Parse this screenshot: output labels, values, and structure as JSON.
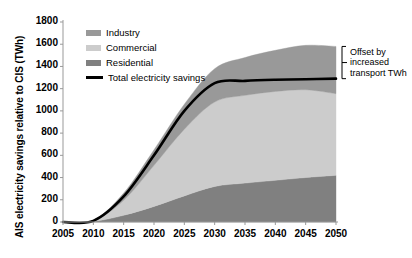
{
  "chart_data": {
    "type": "area",
    "stacked": true,
    "title": "",
    "subtitle": "",
    "xlabel": "",
    "ylabel": "AIS electricity savings relative to CIS  (TWh)",
    "x": [
      2005,
      2010,
      2015,
      2020,
      2025,
      2030,
      2035,
      2040,
      2045,
      2050
    ],
    "xlim": [
      2005,
      2050
    ],
    "ylim": [
      0,
      1800
    ],
    "ytick_labels": [
      "0",
      "200",
      "400",
      "600",
      "800",
      "1000",
      "1200",
      "1400",
      "1600",
      "1800"
    ],
    "ytick_values": [
      0,
      200,
      400,
      600,
      800,
      1000,
      1200,
      1400,
      1600,
      1800
    ],
    "xtick_labels": [
      "2005",
      "2010",
      "2015",
      "2020",
      "2025",
      "2030",
      "2035",
      "2040",
      "2045",
      "2050"
    ],
    "grid": false,
    "legend_position": "top-left-inside",
    "series": [
      {
        "name": "Residential",
        "color": "#808080",
        "kind": "stacked-area",
        "values": [
          0,
          5,
          60,
          140,
          235,
          320,
          350,
          375,
          400,
          420
        ]
      },
      {
        "name": "Commercial",
        "color": "#cccccc",
        "kind": "stacked-area",
        "values": [
          0,
          5,
          135,
          370,
          600,
          760,
          790,
          800,
          790,
          735
        ]
      },
      {
        "name": "Industry",
        "color": "#999999",
        "kind": "stacked-area",
        "values": [
          0,
          5,
          65,
          140,
          225,
          300,
          340,
          370,
          400,
          425
        ]
      },
      {
        "name": "Total electricity savings",
        "color": "#000000",
        "kind": "line",
        "values": [
          0,
          10,
          230,
          600,
          1000,
          1250,
          1270,
          1280,
          1285,
          1290
        ]
      }
    ],
    "cumulative_totals_2050": {
      "residential_top": 420,
      "commercial_top": 1155,
      "industry_top": 1580,
      "total_line": 1290
    },
    "annotations": [
      {
        "name": "offset-bracket",
        "text_lines": [
          "Offset by",
          "increased",
          "transport TWh"
        ],
        "spans_y": [
          1290,
          1580
        ],
        "at_x": 2050
      }
    ]
  },
  "legend": {
    "items": [
      {
        "label": "Industry",
        "color": "#999999",
        "marker": "swatch"
      },
      {
        "label": "Commercial",
        "color": "#cccccc",
        "marker": "swatch"
      },
      {
        "label": "Residential",
        "color": "#808080",
        "marker": "swatch"
      },
      {
        "label": "Total electricity savings",
        "color": "#000000",
        "marker": "line"
      }
    ]
  },
  "annotation": {
    "line1": "Offset by",
    "line2": "increased",
    "line3": "transport TWh"
  },
  "colors": {
    "industry": "#999999",
    "commercial": "#cccccc",
    "residential": "#808080",
    "total_line": "#000000",
    "axis": "#999999",
    "text": "#000000",
    "background": "#ffffff"
  }
}
